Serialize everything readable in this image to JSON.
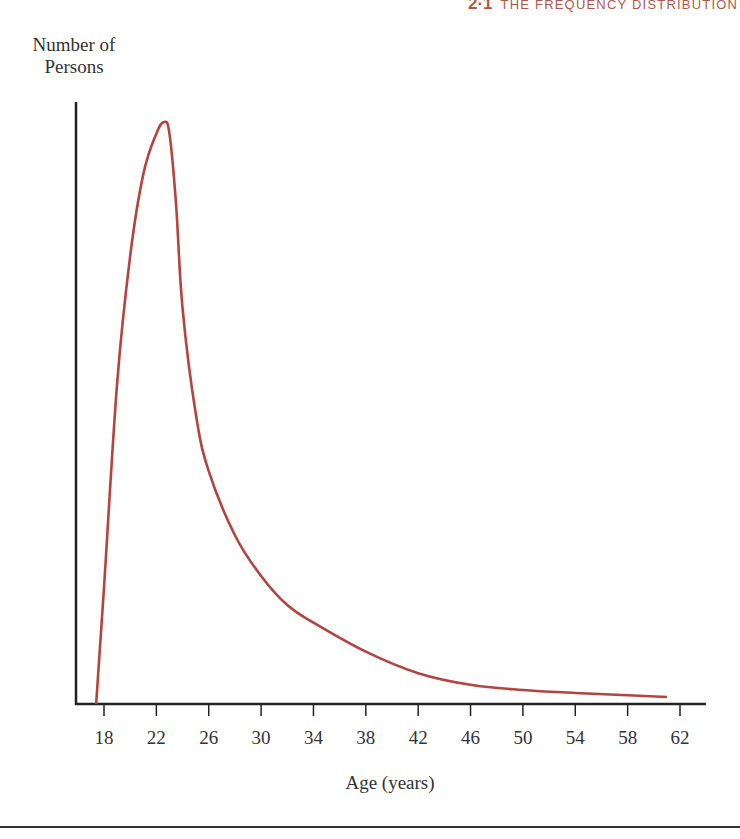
{
  "header": {
    "section_number": "2·1",
    "section_title": "THE FREQUENCY DISTRIBUTION"
  },
  "chart_data": {
    "type": "line",
    "title": "",
    "xlabel": "Age (years)",
    "ylabel": "Number of Persons",
    "xlim": [
      16,
      64
    ],
    "ylim": [
      0,
      100
    ],
    "x_ticks": [
      18,
      22,
      26,
      30,
      34,
      38,
      42,
      46,
      50,
      54,
      58,
      62
    ],
    "y_ticks": [],
    "grid": false,
    "legend": null,
    "series": [
      {
        "name": "Number of Persons",
        "color": "#b5443e",
        "x": [
          17.4,
          18.0,
          19.0,
          20.0,
          21.0,
          22.0,
          22.6,
          23.0,
          23.5,
          24.0,
          25.0,
          26.0,
          28.0,
          30.0,
          32.0,
          34.0,
          38.0,
          42.0,
          46.0,
          50.0,
          54.0,
          58.0,
          61.0
        ],
        "y": [
          0,
          20,
          55,
          77,
          91,
          98,
          100,
          98,
          86,
          68,
          50,
          40,
          29,
          22,
          17,
          14,
          9,
          5.3,
          3.3,
          2.4,
          1.9,
          1.5,
          1.2
        ]
      }
    ]
  },
  "colors": {
    "curve": "#b5443e",
    "axis": "#222222",
    "header": "#b5574a"
  }
}
